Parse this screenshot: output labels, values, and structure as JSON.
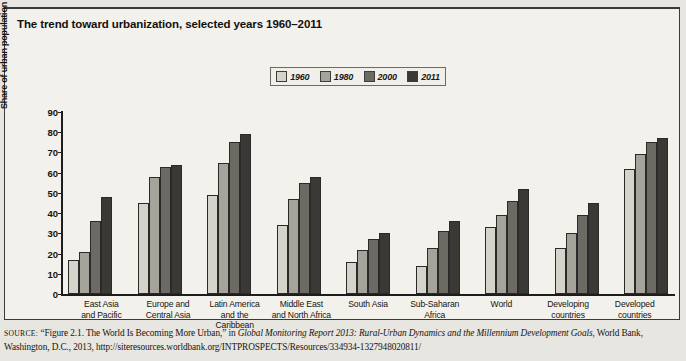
{
  "title": "The trend toward urbanization, selected years 1960–2011",
  "legend": {
    "position": "top-center",
    "entries": [
      {
        "label": "1960",
        "color": "#d6d3cb"
      },
      {
        "label": "1980",
        "color": "#a6a39b"
      },
      {
        "label": "2000",
        "color": "#6d6a64"
      },
      {
        "label": "2011",
        "color": "#3b3935"
      }
    ]
  },
  "source": {
    "prefix": "SOURCE:",
    "line1_a": "“Figure 2.1. The World Is Becoming More Urban,” in ",
    "line1_italic": "Global Monitoring Report 2013: Rural-Urban Dynamics and the Millennium Development Goals",
    "line2": ", World Bank, Washington, D.C., 2013, http://siteresources.worldbank.org/INTPROSPECTS/Resources/334934-1327948020811/"
  },
  "chart_data": {
    "type": "bar",
    "title": "The trend toward urbanization, selected years 1960–2011",
    "xlabel": "",
    "ylabel": "Share of urban population (% of total population)",
    "ylim": [
      0,
      90
    ],
    "yticks": [
      0,
      10,
      20,
      30,
      40,
      50,
      60,
      70,
      80,
      90
    ],
    "grid": false,
    "legend_position": "top-center",
    "categories": [
      "East Asia and Pacific",
      "Europe and Central Asia",
      "Latin America and the Caribbean",
      "Middle East and North Africa",
      "South Asia",
      "Sub-Saharan Africa",
      "World",
      "Developing countries",
      "Developed countries"
    ],
    "category_lines": [
      [
        "East Asia",
        "and Pacific"
      ],
      [
        "Europe and",
        "Central Asia"
      ],
      [
        "Latin America",
        "and the Caribbean"
      ],
      [
        "Middle East",
        "and North Africa"
      ],
      [
        "South Asia",
        ""
      ],
      [
        "Sub-Saharan",
        "Africa"
      ],
      [
        "World",
        ""
      ],
      [
        "Developing",
        "countries"
      ],
      [
        "Developed",
        "countries"
      ]
    ],
    "series": [
      {
        "name": "1960",
        "color": "#d6d3cb",
        "values": [
          17,
          45,
          49,
          34,
          16,
          14,
          33,
          23,
          62
        ]
      },
      {
        "name": "1980",
        "color": "#a6a39b",
        "values": [
          21,
          58,
          65,
          47,
          22,
          23,
          39,
          30,
          69
        ]
      },
      {
        "name": "2000",
        "color": "#6d6a64",
        "values": [
          36,
          63,
          75,
          55,
          27,
          31,
          46,
          39,
          75
        ]
      },
      {
        "name": "2011",
        "color": "#3b3935",
        "values": [
          48,
          64,
          79,
          58,
          30,
          36,
          52,
          45,
          77
        ]
      }
    ]
  }
}
